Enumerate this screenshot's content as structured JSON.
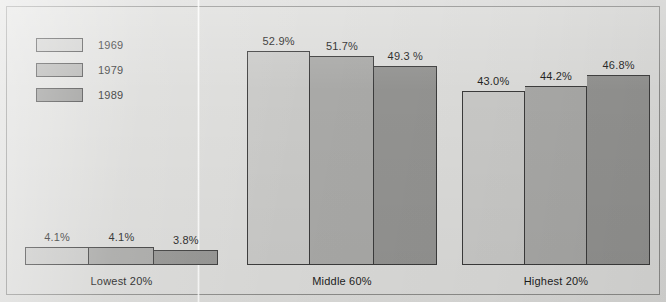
{
  "colors": {
    "background": "#dcdcda",
    "frame_border": "#8d8d8b",
    "bar_outline": "#3b3b3b",
    "text": "#1c1c1c",
    "series_1969": "#c9c9c7",
    "series_1979": "#a9a9a7",
    "series_1989": "#939391"
  },
  "legend": {
    "items": [
      {
        "label": "1969",
        "color": "#c9c9c7"
      },
      {
        "label": "1979",
        "color": "#a9a9a7"
      },
      {
        "label": "1989",
        "color": "#939391"
      }
    ]
  },
  "chart_data": {
    "type": "bar",
    "title": "",
    "subtitle": "",
    "xlabel": "",
    "ylabel": "",
    "ylim": [
      0,
      56
    ],
    "grid": false,
    "legend_position": "top-left",
    "categories": [
      "Lowest 20%",
      "Middle 60%",
      "Highest 20%"
    ],
    "series": [
      {
        "name": "1969",
        "color": "#c9c9c7",
        "values": [
          4.1,
          52.9,
          43.0
        ],
        "labels": [
          "4.1%",
          "52.9%",
          "43.0%"
        ]
      },
      {
        "name": "1979",
        "color": "#a9a9a7",
        "values": [
          4.1,
          51.7,
          44.2
        ],
        "labels": [
          "4.1%",
          "51.7%",
          "44.2%"
        ]
      },
      {
        "name": "1989",
        "color": "#939391",
        "values": [
          3.8,
          49.3,
          46.8
        ],
        "labels": [
          "3.8%",
          "49.3 %",
          "46.8%"
        ]
      }
    ]
  },
  "groups": [
    {
      "label": "Lowest 20%",
      "left": 25,
      "width": 193,
      "bars": [
        {
          "series": "1969",
          "label": "4.1%",
          "value": 4.1,
          "color": "#c9c9c7",
          "height": 18
        },
        {
          "series": "1979",
          "label": "4.1%",
          "value": 4.1,
          "color": "#a9a9a7",
          "height": 18
        },
        {
          "series": "1989",
          "label": "3.8%",
          "value": 3.8,
          "color": "#939391",
          "height": 15
        }
      ]
    },
    {
      "label": "Middle 60%",
      "left": 247,
      "width": 190,
      "bars": [
        {
          "series": "1969",
          "label": "52.9%",
          "value": 52.9,
          "color": "#c9c9c7",
          "height": 214
        },
        {
          "series": "1979",
          "label": "51.7%",
          "value": 51.7,
          "color": "#a9a9a7",
          "height": 209
        },
        {
          "series": "1989",
          "label": "49.3 %",
          "value": 49.3,
          "color": "#939391",
          "height": 199
        }
      ]
    },
    {
      "label": "Highest 20%",
      "left": 462,
      "width": 188,
      "bars": [
        {
          "series": "1969",
          "label": "43.0%",
          "value": 43.0,
          "color": "#c9c9c7",
          "height": 174
        },
        {
          "series": "1979",
          "label": "44.2%",
          "value": 44.2,
          "color": "#a9a9a7",
          "height": 179
        },
        {
          "series": "1989",
          "label": "46.8%",
          "value": 46.8,
          "color": "#939391",
          "height": 190
        }
      ]
    }
  ]
}
